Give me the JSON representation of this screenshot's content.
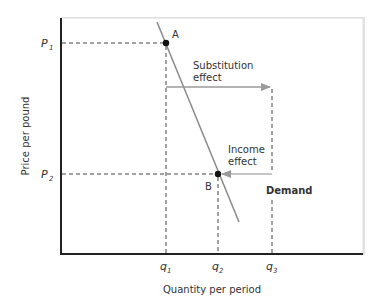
{
  "diagram": {
    "title": "",
    "type": "economics-demand-curve",
    "axes": {
      "x_label": "Quantity per period",
      "y_label": "Price per pound",
      "x_ticks": [
        {
          "label": "q",
          "sub": "1"
        },
        {
          "label": "q",
          "sub": "2"
        },
        {
          "label": "q",
          "sub": "3"
        }
      ],
      "y_ticks": [
        {
          "label": "P",
          "sub": "1"
        },
        {
          "label": "P",
          "sub": "2"
        }
      ]
    },
    "points": [
      {
        "label": "A",
        "x": "q1",
        "y": "P1"
      },
      {
        "label": "B",
        "x": "q2",
        "y": "P2"
      }
    ],
    "curve_label": "Demand",
    "annotations": {
      "substitution_line1": "Substitution",
      "substitution_line2": "effect",
      "income_line1": "Income",
      "income_line2": "effect"
    },
    "colors": {
      "axis": "#222222",
      "curve": "#8a8a8a",
      "arrow": "#9a9a9a",
      "dashed": "#444444",
      "point": "#111111",
      "frame_shadow": "#d0d0d0"
    }
  }
}
